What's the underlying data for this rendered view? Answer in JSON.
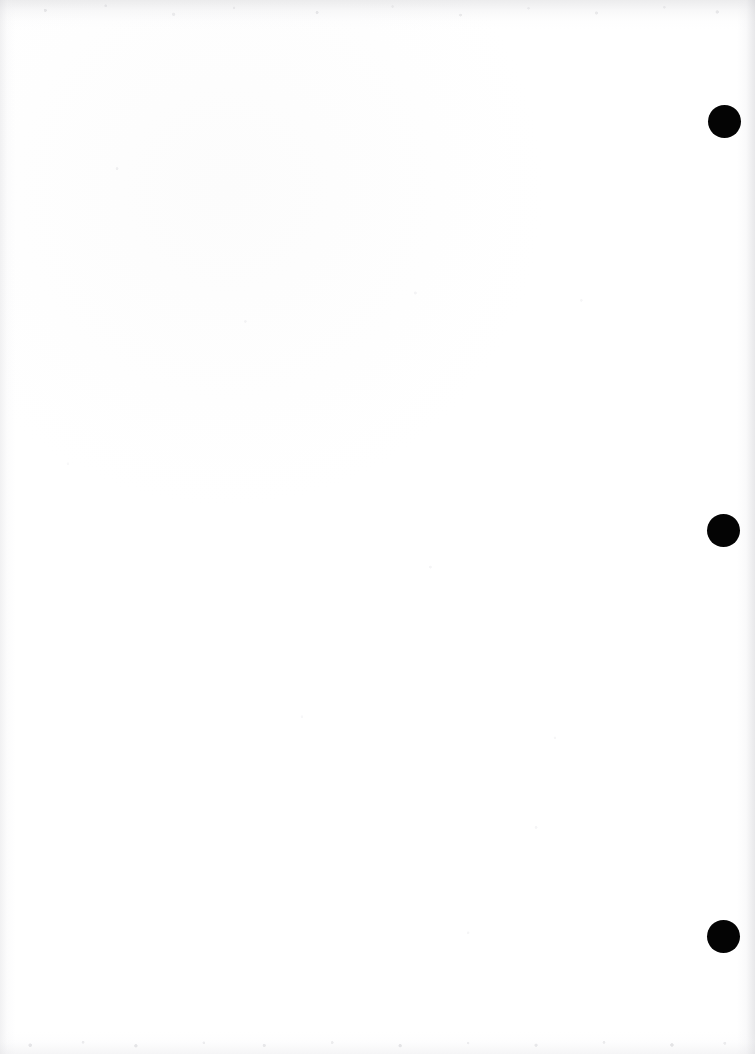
{
  "document": {
    "page_kind": "scanned-blank-page",
    "page_width": 755,
    "page_height": 1054,
    "background_color": "#ffffff",
    "visible_text": "",
    "body_text": ""
  },
  "marks": {
    "ink_color": "#040404",
    "registration_dots": [
      {
        "name": "registration-dot-top",
        "cx": 724,
        "cy": 121,
        "diameter": 33
      },
      {
        "name": "registration-dot-middle",
        "cx": 723,
        "cy": 530,
        "diameter": 33
      },
      {
        "name": "registration-dot-bottom",
        "cx": 723,
        "cy": 936,
        "diameter": 33
      }
    ]
  },
  "scan_artifacts": {
    "top_edge_shadow_color": "#cdcdd0",
    "left_edge_shadow_color": "#d6d6da",
    "right_edge_shadow_color": "#c8c8cd",
    "bottom_edge_shadow_color": "#dedee2"
  }
}
